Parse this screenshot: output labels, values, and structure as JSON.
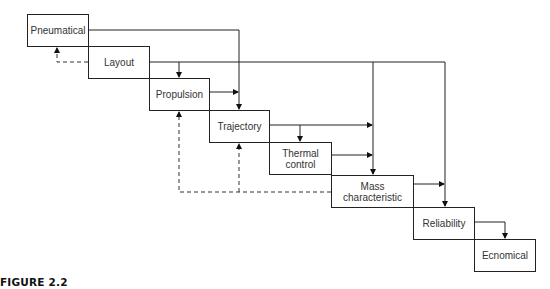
{
  "diagram": {
    "nodes": [
      {
        "id": "pneumatical",
        "label": "Pneumatical"
      },
      {
        "id": "layout",
        "label": "Layout"
      },
      {
        "id": "propulsion",
        "label": "Propulsion"
      },
      {
        "id": "trajectory",
        "label": "Trajectory"
      },
      {
        "id": "thermal",
        "label": "Thermal control"
      },
      {
        "id": "mass",
        "label": "Mass characteristic"
      },
      {
        "id": "reliability",
        "label": "Reliability"
      },
      {
        "id": "economical",
        "label": "Ecnomical"
      }
    ],
    "edges_solid": [
      {
        "from": "pneumatical",
        "to": "trajectory"
      },
      {
        "from": "layout",
        "to": "propulsion"
      },
      {
        "from": "layout",
        "to": "mass"
      },
      {
        "from": "layout",
        "to": "reliability"
      },
      {
        "from": "propulsion",
        "to": "trajectory"
      },
      {
        "from": "trajectory",
        "to": "thermal"
      },
      {
        "from": "trajectory",
        "to": "mass"
      },
      {
        "from": "thermal",
        "to": "mass"
      },
      {
        "from": "mass",
        "to": "reliability"
      },
      {
        "from": "reliability",
        "to": "economical"
      }
    ],
    "edges_dashed": [
      {
        "from": "layout",
        "to": "pneumatical"
      },
      {
        "from": "mass",
        "to": "propulsion"
      },
      {
        "from": "mass",
        "to": "trajectory"
      }
    ]
  },
  "caption": "FIGURE 2.2"
}
